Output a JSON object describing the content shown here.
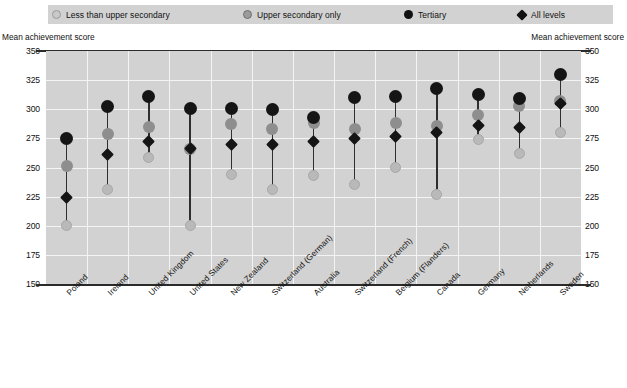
{
  "legend": {
    "items": [
      {
        "label": "Less than upper secondary",
        "icon": "circle-light-icon",
        "color": "#c9c9c9",
        "x": 52
      },
      {
        "label": "Upper secondary only",
        "icon": "circle-gray-icon",
        "color": "#9b9b9b",
        "x": 243
      },
      {
        "label": "Tertiary",
        "icon": "circle-black-icon",
        "color": "#111111",
        "x": 404
      },
      {
        "label": "All levels",
        "icon": "diamond-black-icon",
        "color": "#111111",
        "x": 518
      }
    ]
  },
  "axis": {
    "caption_left": "Mean achievement score",
    "caption_right": "Mean achievement score",
    "ticks": [
      "350",
      "325",
      "300",
      "275",
      "250",
      "225",
      "200",
      "175",
      "150"
    ]
  },
  "chart_data": {
    "type": "scatter",
    "title": "",
    "subtitle": "",
    "xlabel": "",
    "ylabel": "Mean achievement score",
    "ylim": [
      150,
      350
    ],
    "ytick_step": 25,
    "grid": true,
    "legend_position": "top",
    "categories": [
      "Poland",
      "Ireland",
      "United Kingdom",
      "United States",
      "New Zealand",
      "Switzerland (German)",
      "Australia",
      "Switzerland (French)",
      "Belgium (Flanders)",
      "Canada",
      "Germany",
      "Netherlands",
      "Sweden"
    ],
    "series": [
      {
        "name": "Less than upper secondary",
        "color": "#b9b9b9",
        "marker": "circle",
        "values": [
          200,
          231,
          259,
          200,
          244,
          231,
          243,
          235,
          250,
          227,
          274,
          262,
          280
        ]
      },
      {
        "name": "Upper secondary only",
        "color": "#8e8e8e",
        "marker": "circle",
        "values": [
          251,
          279,
          285,
          266,
          287,
          283,
          288,
          283,
          288,
          286,
          295,
          303,
          307
        ]
      },
      {
        "name": "Tertiary",
        "color": "#151515",
        "marker": "circle",
        "values": [
          275,
          302,
          311,
          301,
          301,
          300,
          293,
          310,
          311,
          318,
          313,
          309,
          330
        ]
      },
      {
        "name": "All levels",
        "color": "#151515",
        "marker": "diamond",
        "values": [
          224,
          261,
          272,
          266,
          270,
          270,
          272,
          275,
          277,
          280,
          286,
          284,
          305
        ]
      }
    ]
  }
}
